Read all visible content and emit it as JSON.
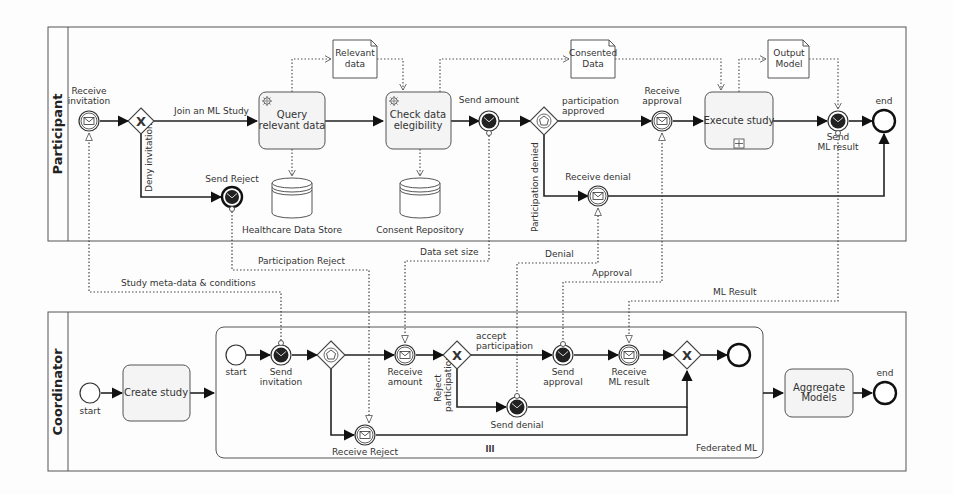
{
  "diagram": {
    "type": "BPMN collaboration",
    "pools": {
      "participant": {
        "label": "Participant",
        "events": {
          "receive_invitation": "Receive invitation",
          "receive_invitation_l1": "Receive",
          "receive_invitation_l2": "invitation",
          "send_reject": "Send Reject",
          "send_amount": "Send amount",
          "receive_approval_l1": "Receive",
          "receive_approval_l2": "approval",
          "receive_denial": "Receive denial",
          "send_ml_result_l1": "Send",
          "send_ml_result_l2": "ML result",
          "end": "end"
        },
        "tasks": {
          "query_l1": "Query",
          "query_l2": "relevant data",
          "check_l1": "Check data",
          "check_l2": "elegibility",
          "execute": "Execute study"
        },
        "flows": {
          "join": "Join an ML Study",
          "deny": "Deny invitation",
          "approved_l1": "participation",
          "approved_l2": "approved",
          "denied": "Participation denied"
        },
        "data_objects": {
          "relevant_l1": "Relevant",
          "relevant_l2": "data",
          "consented_l1": "Consented",
          "consented_l2": "Data",
          "output_l1": "Output",
          "output_l2": "Model"
        },
        "data_stores": {
          "healthcare": "Healthcare Data Store",
          "consent": "Consent Repository"
        }
      },
      "coordinator": {
        "label": "Coordinator",
        "events": {
          "start": "start",
          "sub_start": "start",
          "send_invitation_l1": "Send",
          "send_invitation_l2": "invitation",
          "receive_amount_l1": "Receive",
          "receive_amount_l2": "amount",
          "send_approval_l1": "Send",
          "send_approval_l2": "approval",
          "receive_ml_l1": "Receive",
          "receive_ml_l2": "ML result",
          "send_denial": "Send denial",
          "receive_reject": "Receive Reject",
          "end": "end"
        },
        "tasks": {
          "create_study": "Create study",
          "aggregate_l1": "Aggregate",
          "aggregate_l2": "Models"
        },
        "flows": {
          "accept_l1": "accept",
          "accept_l2": "participation",
          "reject_l1": "Reject",
          "reject_l2": "participation"
        },
        "subprocess": {
          "label": "Federated ML",
          "marker": "III"
        }
      }
    },
    "message_flows": {
      "study_meta": "Study meta-data & conditions",
      "participation_reject": "Participation Reject",
      "data_set_size": "Data set size",
      "denial": "Denial",
      "approval": "Approval",
      "ml_result": "ML Result"
    }
  }
}
